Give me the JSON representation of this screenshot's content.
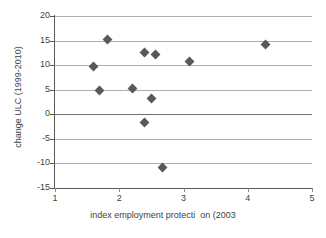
{
  "chart_data": {
    "type": "scatter",
    "title": "",
    "xlabel": "index employment protecti  on (2003",
    "ylabel": "change ULC (1999-2010)",
    "xlim": [
      1,
      5
    ],
    "ylim": [
      -15,
      20
    ],
    "xticks": [
      "1",
      "2",
      "3",
      "4",
      "5"
    ],
    "yticks": [
      "20",
      "15",
      "10",
      "5",
      "0",
      "-5",
      "-10",
      "-15"
    ],
    "xtick_values": [
      1,
      2,
      3,
      4,
      5
    ],
    "ytick_values": [
      20,
      15,
      10,
      5,
      0,
      -5,
      -10,
      -15
    ],
    "grid": "horizontal",
    "legend": "none",
    "marker_shape": "diamond",
    "marker_color": "#595959",
    "points": [
      {
        "x": 1.6,
        "y": 9.7
      },
      {
        "x": 1.7,
        "y": 4.9
      },
      {
        "x": 1.81,
        "y": 15.2
      },
      {
        "x": 2.2,
        "y": 5.3
      },
      {
        "x": 2.4,
        "y": 12.5
      },
      {
        "x": 2.4,
        "y": -1.7
      },
      {
        "x": 2.5,
        "y": 3.3
      },
      {
        "x": 2.56,
        "y": 12.1
      },
      {
        "x": 2.68,
        "y": -10.9
      },
      {
        "x": 3.1,
        "y": 10.8
      },
      {
        "x": 4.28,
        "y": 14.2
      }
    ]
  },
  "colors": {
    "marker": "#595959",
    "gridline": "#aeaeae",
    "zero_line": "#6f6f6f",
    "axis": "#5a5a5a",
    "text": "#3f3f3f",
    "background": "#ffffff"
  }
}
